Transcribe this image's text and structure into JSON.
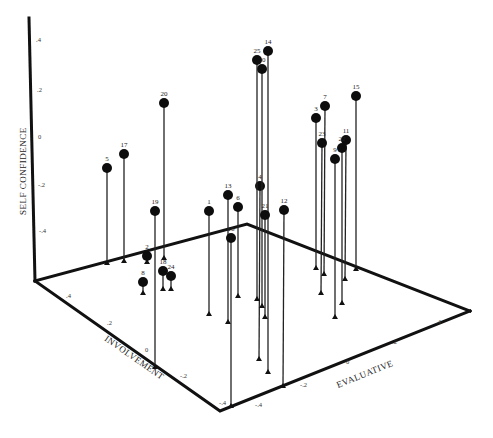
{
  "chart_data": {
    "type": "scatter3d",
    "title": "",
    "axes": {
      "z": {
        "label": "SELF CONFIDENCE",
        "ticks": [
          ".4",
          ".2",
          "0",
          "-.2",
          "-.4"
        ]
      },
      "x": {
        "label": "INVOLVEMENT",
        "ticks": [
          ".4",
          ".2",
          "0",
          "-.2",
          "-.4"
        ]
      },
      "y": {
        "label": "EVALUATIVE",
        "ticks": [
          "-.4",
          "-.2",
          "0",
          ".2",
          ".4"
        ]
      }
    },
    "points": [
      {
        "id": "1",
        "px": 209,
        "py": 211,
        "bx": 209,
        "by": 315
      },
      {
        "id": "2",
        "px": 147,
        "py": 256,
        "bx": 147,
        "by": 263
      },
      {
        "id": "3",
        "px": 316,
        "py": 118,
        "bx": 316,
        "by": 269
      },
      {
        "id": "4",
        "px": 260,
        "py": 186,
        "bx": 259,
        "by": 360
      },
      {
        "id": "5",
        "px": 107,
        "py": 168,
        "bx": 107,
        "by": 264
      },
      {
        "id": "6",
        "px": 238,
        "py": 207,
        "bx": 238,
        "by": 297
      },
      {
        "id": "7",
        "px": 325,
        "py": 106,
        "bx": 324,
        "by": 275
      },
      {
        "id": "8",
        "px": 143,
        "py": 282,
        "bx": 143,
        "by": 294
      },
      {
        "id": "9",
        "px": 335,
        "py": 159,
        "bx": 335,
        "by": 318
      },
      {
        "id": "10",
        "px": 262,
        "py": 69,
        "bx": 262,
        "by": 307
      },
      {
        "id": "11",
        "px": 346,
        "py": 140,
        "bx": 345,
        "by": 280
      },
      {
        "id": "12",
        "px": 284,
        "py": 210,
        "bx": 283,
        "by": 387
      },
      {
        "id": "13",
        "px": 228,
        "py": 195,
        "bx": 228,
        "by": 323
      },
      {
        "id": "14",
        "px": 268,
        "py": 51,
        "bx": 268,
        "by": 373
      },
      {
        "id": "15",
        "px": 356,
        "py": 96,
        "bx": 356,
        "by": 270
      },
      {
        "id": "16",
        "px": 231,
        "py": 238,
        "bx": 231,
        "by": 407
      },
      {
        "id": "17",
        "px": 124,
        "py": 154,
        "bx": 124,
        "by": 262
      },
      {
        "id": "18",
        "px": 163,
        "py": 271,
        "bx": 163,
        "by": 290
      },
      {
        "id": "19",
        "px": 155,
        "py": 211,
        "bx": 155,
        "by": 368
      },
      {
        "id": "20",
        "px": 164,
        "py": 103,
        "bx": 164,
        "by": 259
      },
      {
        "id": "21",
        "px": 265,
        "py": 215,
        "bx": 265,
        "by": 318
      },
      {
        "id": "22",
        "px": 342,
        "py": 148,
        "bx": 342,
        "by": 304
      },
      {
        "id": "23",
        "px": 322,
        "py": 143,
        "bx": 321,
        "by": 294
      },
      {
        "id": "24",
        "px": 171,
        "py": 276,
        "bx": 171,
        "by": 290
      },
      {
        "id": "25",
        "px": 257,
        "py": 60,
        "bx": 257,
        "by": 300
      }
    ]
  }
}
